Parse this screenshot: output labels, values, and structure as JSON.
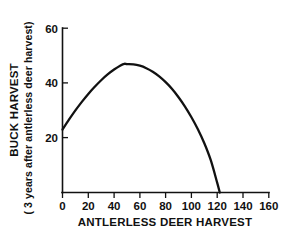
{
  "chart_data": {
    "type": "line",
    "title": "",
    "xlabel": "ANTLERLESS DEER HARVEST",
    "ylabel_line1": "BUCK HARVEST",
    "ylabel_line2": "( 3 years after antlerless deer harvest)",
    "xlim": [
      0,
      160
    ],
    "ylim": [
      0,
      60
    ],
    "xticks": [
      0,
      20,
      40,
      60,
      80,
      100,
      120,
      140,
      160
    ],
    "xtick_labels": [
      "0",
      "20",
      "40",
      "60",
      "80",
      "100",
      "120",
      "140",
      "160"
    ],
    "yticks": [
      20,
      40,
      60
    ],
    "ytick_labels": [
      "20",
      "40",
      "60"
    ],
    "grid": false,
    "legend": false,
    "legend_position": "none",
    "series": [
      {
        "name": "buck harvest response",
        "x": [
          0,
          5,
          10,
          15,
          20,
          25,
          30,
          35,
          40,
          45,
          48,
          50,
          55,
          60,
          65,
          70,
          75,
          80,
          85,
          90,
          95,
          100,
          105,
          110,
          115,
          120,
          122
        ],
        "values": [
          23.0,
          26.6,
          30.0,
          33.1,
          36.0,
          38.6,
          41.0,
          43.1,
          44.9,
          46.4,
          47.0,
          46.9,
          46.8,
          46.3,
          45.4,
          44.1,
          42.4,
          40.3,
          37.8,
          34.8,
          31.4,
          27.5,
          23.1,
          18.0,
          11.8,
          3.5,
          0.0
        ]
      }
    ],
    "annotations": [],
    "line_color": "#111111",
    "axis_color": "#111111",
    "background_color": "#ffffff"
  },
  "figure": {
    "x_axis_name": "antlerless-deer-harvest-axis",
    "y_axis_name": "buck-harvest-axis"
  }
}
